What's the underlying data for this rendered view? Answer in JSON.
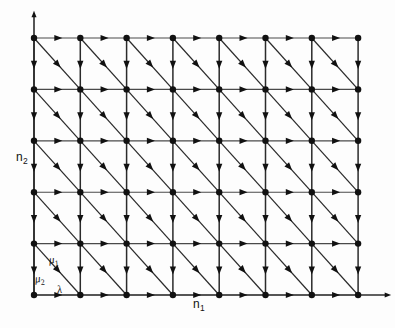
{
  "figure": {
    "type": "lattice-transition-diagram",
    "background_color": "#fdfdfd",
    "line_color": "#2b2b2b",
    "grid_line_color": "#4a4a4a",
    "node_color": "#111111"
  },
  "axes": {
    "x": {
      "label": "n",
      "subscript": "1",
      "label_text": "n₁",
      "arrow": true,
      "origin_px": [
        34,
        295
      ],
      "end_px": [
        388,
        295
      ]
    },
    "y": {
      "label": "n",
      "subscript": "2",
      "label_text": "n₂",
      "arrow": true,
      "origin_px": [
        34,
        295
      ],
      "end_px": [
        34,
        14
      ]
    }
  },
  "lattice": {
    "columns": 8,
    "rows": 6,
    "x_start": 34,
    "y_start": 295,
    "dx": 46.3,
    "dy": 51.4,
    "node_radius": 3.2
  },
  "transitions": [
    {
      "name": "lambda",
      "symbol": "λ",
      "direction": "right",
      "vector": [
        1,
        0
      ],
      "meaning": "arrival transition along n1"
    },
    {
      "name": "mu2",
      "symbol": "μ",
      "subscript": "2",
      "symbol_text": "μ₂",
      "direction": "down",
      "vector": [
        0,
        -1
      ],
      "meaning": "service transition along n2"
    },
    {
      "name": "mu1",
      "symbol": "μ",
      "subscript": "1",
      "symbol_text": "μ₁",
      "direction": "down-right",
      "vector": [
        1,
        -1
      ],
      "meaning": "service transition diagonal"
    }
  ],
  "labels": {
    "n1": {
      "base": "n",
      "sub": "1"
    },
    "n2": {
      "base": "n",
      "sub": "2"
    },
    "mu1": {
      "base": "μ",
      "sub": "1"
    },
    "mu2": {
      "base": "μ",
      "sub": "2"
    },
    "lambda": {
      "base": "λ",
      "sub": ""
    }
  }
}
